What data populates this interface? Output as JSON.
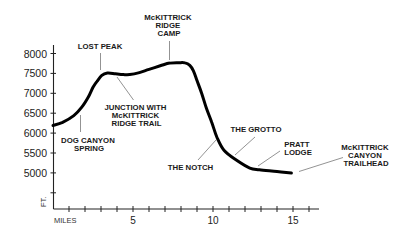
{
  "chart_data": {
    "type": "line",
    "title": "",
    "xlabel": "MILES",
    "ylabel": "FT.",
    "xlim": [
      0,
      16
    ],
    "ylim": [
      4100,
      8000
    ],
    "grid": false,
    "legend": "none",
    "x_ticks": [
      1,
      2,
      3,
      4,
      5,
      6,
      7,
      8,
      9,
      10,
      11,
      12,
      13,
      14,
      15,
      16
    ],
    "x_tick_labels": [
      "5",
      "10",
      "15"
    ],
    "y_ticks": [
      4500,
      5000,
      5500,
      6000,
      6500,
      7000,
      7500,
      8000
    ],
    "y_tick_labels": [
      "8000",
      "7500",
      "7000",
      "6500",
      "6000",
      "5500",
      "5000"
    ],
    "series": [
      {
        "name": "Trail elevation profile",
        "x": [
          0,
          0.6,
          1.3,
          1.8,
          2.2,
          2.5,
          2.75,
          3.05,
          3.4,
          3.9,
          4.4,
          4.8,
          5.4,
          6.0,
          6.7,
          7.3,
          7.9,
          8.25,
          8.55,
          8.77,
          9.0,
          9.3,
          9.6,
          9.92,
          10.25,
          10.7,
          11.5,
          12.3,
          12.9,
          14.0,
          14.9
        ],
        "y": [
          6190,
          6270,
          6440,
          6650,
          6900,
          7150,
          7300,
          7450,
          7510,
          7490,
          7470,
          7470,
          7520,
          7600,
          7690,
          7760,
          7770,
          7765,
          7700,
          7570,
          7320,
          6990,
          6610,
          6275,
          5890,
          5560,
          5310,
          5120,
          5080,
          5035,
          4995
        ]
      }
    ],
    "annotations": [
      {
        "lines": [
          "LOST PEAK"
        ],
        "mile": 3.0,
        "elevation": 7450
      },
      {
        "lines": [
          "McKITTRICK",
          "RIDGE",
          "CAMP"
        ],
        "mile": 7.3,
        "elevation": 7760
      },
      {
        "lines": [
          "JUNCTION WITH",
          "McKITTRICK",
          "RIDGE TRAIL"
        ],
        "mile": 3.95,
        "elevation": 7490
      },
      {
        "lines": [
          "DOG CANYON",
          "SPRING"
        ],
        "mile": 1.7,
        "elevation": 6600
      },
      {
        "lines": [
          "THE NOTCH"
        ],
        "mile": 10.25,
        "elevation": 5890
      },
      {
        "lines": [
          "THE GROTTO"
        ],
        "mile": 11.4,
        "elevation": 5330
      },
      {
        "lines": [
          "PRATT",
          "LODGE"
        ],
        "mile": 12.8,
        "elevation": 5085
      },
      {
        "lines": [
          "McKITTRICK",
          "CANYON",
          "TRAILHEAD"
        ],
        "mile": 15.0,
        "elevation": 4990
      }
    ]
  }
}
